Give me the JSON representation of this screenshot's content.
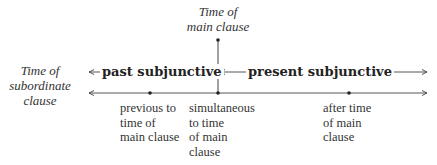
{
  "diagram": {
    "main_clause_label": [
      "Time of",
      "main clause"
    ],
    "subordinate_clause_label": [
      "Time of",
      "subordinate",
      "clause"
    ],
    "ranges": [
      {
        "label": "past subjunctive",
        "direction": "left-of-main"
      },
      {
        "label": "present subjunctive",
        "direction": "right-of-main"
      }
    ],
    "timeline_points": [
      {
        "label": [
          "previous to",
          "time of",
          "main clause"
        ]
      },
      {
        "label": [
          "simultaneous",
          "to time",
          "of main",
          "clause"
        ]
      },
      {
        "label": [
          "after time",
          "of main",
          "clause"
        ]
      }
    ],
    "colors": {
      "line": "#444444",
      "text": "#333333",
      "background": "#ffffff"
    }
  }
}
